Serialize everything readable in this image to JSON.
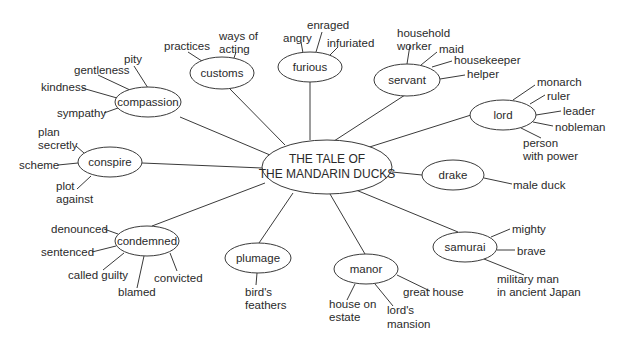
{
  "center": {
    "line1": "THE TALE OF",
    "line2": "THE MANDARIN DUCKS"
  },
  "nodes": {
    "compassion": {
      "label": "compassion",
      "words": [
        "pity",
        "gentleness",
        "kindness",
        "sympathy"
      ]
    },
    "customs": {
      "label": "customs",
      "words": [
        "practices",
        "ways of",
        "acting"
      ]
    },
    "furious": {
      "label": "furious",
      "words": [
        "angry",
        "enraged",
        "infuriated"
      ]
    },
    "servant": {
      "label": "servant",
      "words": [
        "household",
        "worker",
        "maid",
        "housekeeper",
        "helper"
      ]
    },
    "lord": {
      "label": "lord",
      "words": [
        "monarch",
        "ruler",
        "leader",
        "nobleman",
        "person",
        "with power"
      ]
    },
    "conspire": {
      "label": "conspire",
      "words": [
        "plan",
        "secretly",
        "scheme",
        "plot",
        "against"
      ]
    },
    "drake": {
      "label": "drake",
      "words": [
        "male duck"
      ]
    },
    "condemned": {
      "label": "condemned",
      "words": [
        "denounced",
        "sentenced",
        "called guilty",
        "blamed",
        "convicted"
      ]
    },
    "plumage": {
      "label": "plumage",
      "words": [
        "bird's",
        "feathers"
      ]
    },
    "manor": {
      "label": "manor",
      "words": [
        "house on",
        "estate",
        "lord's",
        "mansion",
        "great house"
      ]
    },
    "samurai": {
      "label": "samurai",
      "words": [
        "mighty",
        "brave",
        "military man",
        "in ancient Japan"
      ]
    }
  },
  "colors": {
    "stroke": "#3a3a3a",
    "text": "#2a2a2a",
    "background": "#ffffff"
  }
}
